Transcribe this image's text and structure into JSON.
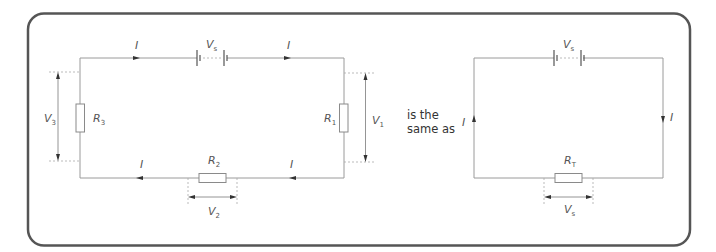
{
  "diagram": {
    "type": "series-circuit-equivalence",
    "colors": {
      "border": "#555555",
      "wire": "#9a9a9a",
      "text": "#555555"
    },
    "connector_text": {
      "line1": "is the",
      "line2": "same as"
    },
    "left_circuit": {
      "source": {
        "symbol": "V",
        "sub": "s"
      },
      "current": {
        "symbol": "I"
      },
      "resistors": [
        {
          "id": "R1",
          "symbol": "R",
          "sub": "1",
          "voltage": {
            "symbol": "V",
            "sub": "1"
          }
        },
        {
          "id": "R2",
          "symbol": "R",
          "sub": "2",
          "voltage": {
            "symbol": "V",
            "sub": "2"
          }
        },
        {
          "id": "R3",
          "symbol": "R",
          "sub": "3",
          "voltage": {
            "symbol": "V",
            "sub": "3"
          }
        }
      ]
    },
    "right_circuit": {
      "source": {
        "symbol": "V",
        "sub": "s"
      },
      "current": {
        "symbol": "I"
      },
      "resistor": {
        "id": "RT",
        "symbol": "R",
        "sub": "T",
        "voltage": {
          "symbol": "V",
          "sub": "s"
        }
      }
    }
  }
}
